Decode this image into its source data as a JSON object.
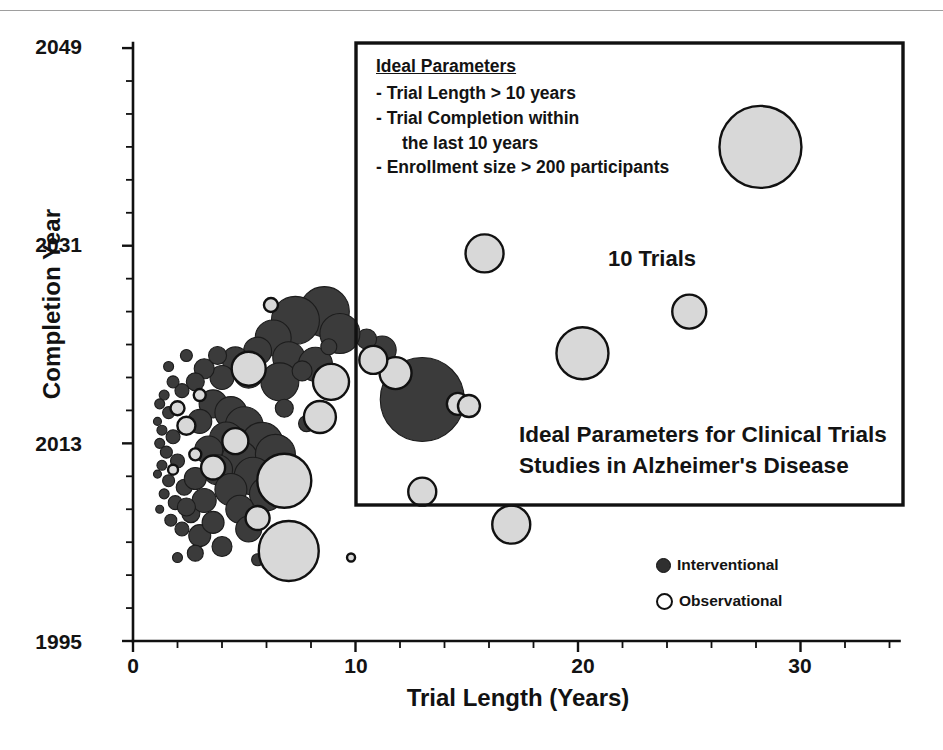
{
  "figure": {
    "caption_title": "Ideal Parameters for Clinical Trials Studies in Alzheimer's Disease",
    "trials_count_label": "10 Trials"
  },
  "callout": {
    "heading": "Ideal Parameters",
    "criteria": [
      "- Trial Length > 10 years",
      "- Trial Completion within",
      "the last 10 years",
      "- Enrollment size > 200 participants"
    ]
  },
  "legend": {
    "position": "bottom-right",
    "entries": [
      {
        "label": "Interventional",
        "marker": "filled-circle",
        "color": "#3b3b3b"
      },
      {
        "label": "Observational",
        "marker": "hollow-circle",
        "color": "#d8d8d8"
      }
    ]
  },
  "axes": {
    "x": {
      "label": "Trial Length (Years)",
      "ticks": [
        "0",
        "10",
        "20",
        "30"
      ],
      "tick_values": [
        0,
        10,
        20,
        30
      ],
      "minor_tick_step": 2,
      "range": [
        0,
        34
      ]
    },
    "y": {
      "label": "Completion Year",
      "ticks": [
        "1995",
        "2013",
        "2031",
        "2049"
      ],
      "tick_values": [
        1995,
        2013,
        2031,
        2049
      ],
      "minor_tick_step": 3,
      "range": [
        1995,
        2049
      ]
    }
  },
  "colors": {
    "interventional_fill": "#3b3b3b",
    "observational_fill": "#d8d8d8",
    "stroke": "#111111",
    "background": "#ffffff"
  },
  "chart_data": {
    "type": "scatter",
    "title": "Ideal Parameters for Clinical Trials Studies in Alzheimer's Disease",
    "xlabel": "Trial Length (Years)",
    "ylabel": "Completion Year",
    "xlim": [
      0,
      34
    ],
    "ylim": [
      1995,
      2049
    ],
    "grid": false,
    "legend_position": "bottom-right",
    "bubble_size_encodes": "Enrollment size (participants)",
    "annotations": [
      {
        "text": "10 Trials",
        "x": 21.5,
        "y": 2030.5
      },
      {
        "text": "Ideal Parameters for Clinical Trials Studies in Alzheimer's Disease",
        "x": 17.5,
        "y": 2013.5
      }
    ],
    "highlight_region": {
      "label": "Ideal Parameters region",
      "x_range": [
        10,
        34
      ],
      "y_range": [
        2009,
        2049
      ]
    },
    "series": [
      {
        "name": "Interventional",
        "marker": "filled-circle",
        "color": "#3b3b3b",
        "points": [
          {
            "x": 13.0,
            "y": 2017.0,
            "r": 42
          },
          {
            "x": 11.2,
            "y": 2021.5,
            "r": 14
          },
          {
            "x": 10.5,
            "y": 2022.5,
            "r": 10
          },
          {
            "x": 8.6,
            "y": 2025.0,
            "r": 25
          },
          {
            "x": 7.3,
            "y": 2024.2,
            "r": 24
          },
          {
            "x": 9.3,
            "y": 2023.0,
            "r": 20
          },
          {
            "x": 6.3,
            "y": 2022.6,
            "r": 18
          },
          {
            "x": 5.6,
            "y": 2021.4,
            "r": 14
          },
          {
            "x": 7.0,
            "y": 2020.8,
            "r": 16
          },
          {
            "x": 8.2,
            "y": 2020.2,
            "r": 17
          },
          {
            "x": 4.6,
            "y": 2020.6,
            "r": 13
          },
          {
            "x": 5.2,
            "y": 2019.4,
            "r": 15
          },
          {
            "x": 6.6,
            "y": 2018.6,
            "r": 19
          },
          {
            "x": 4.0,
            "y": 2019.0,
            "r": 12
          },
          {
            "x": 3.2,
            "y": 2019.8,
            "r": 10
          },
          {
            "x": 3.8,
            "y": 2021.0,
            "r": 9
          },
          {
            "x": 2.8,
            "y": 2018.6,
            "r": 9
          },
          {
            "x": 2.2,
            "y": 2017.8,
            "r": 7
          },
          {
            "x": 1.8,
            "y": 2018.6,
            "r": 6
          },
          {
            "x": 1.4,
            "y": 2017.4,
            "r": 5
          },
          {
            "x": 1.2,
            "y": 2016.6,
            "r": 5
          },
          {
            "x": 1.6,
            "y": 2015.8,
            "r": 6
          },
          {
            "x": 1.1,
            "y": 2015.0,
            "r": 4
          },
          {
            "x": 1.3,
            "y": 2014.2,
            "r": 5
          },
          {
            "x": 1.8,
            "y": 2013.6,
            "r": 7
          },
          {
            "x": 1.2,
            "y": 2013.0,
            "r": 5
          },
          {
            "x": 1.5,
            "y": 2012.2,
            "r": 6
          },
          {
            "x": 2.0,
            "y": 2011.4,
            "r": 7
          },
          {
            "x": 1.3,
            "y": 2011.0,
            "r": 5
          },
          {
            "x": 1.1,
            "y": 2010.2,
            "r": 4
          },
          {
            "x": 1.6,
            "y": 2009.6,
            "r": 6
          },
          {
            "x": 2.3,
            "y": 2009.0,
            "r": 8
          },
          {
            "x": 1.4,
            "y": 2008.4,
            "r": 5
          },
          {
            "x": 1.9,
            "y": 2007.6,
            "r": 7
          },
          {
            "x": 1.2,
            "y": 2007.0,
            "r": 4
          },
          {
            "x": 2.6,
            "y": 2006.6,
            "r": 9
          },
          {
            "x": 1.7,
            "y": 2006.0,
            "r": 6
          },
          {
            "x": 2.2,
            "y": 2005.2,
            "r": 7
          },
          {
            "x": 3.0,
            "y": 2004.6,
            "r": 11
          },
          {
            "x": 3.6,
            "y": 2016.6,
            "r": 14
          },
          {
            "x": 4.4,
            "y": 2015.8,
            "r": 16
          },
          {
            "x": 3.0,
            "y": 2015.0,
            "r": 12
          },
          {
            "x": 5.0,
            "y": 2014.6,
            "r": 19
          },
          {
            "x": 4.2,
            "y": 2013.4,
            "r": 17
          },
          {
            "x": 5.8,
            "y": 2013.0,
            "r": 21
          },
          {
            "x": 3.4,
            "y": 2012.4,
            "r": 14
          },
          {
            "x": 4.8,
            "y": 2011.6,
            "r": 18
          },
          {
            "x": 6.4,
            "y": 2012.0,
            "r": 20
          },
          {
            "x": 3.8,
            "y": 2010.6,
            "r": 15
          },
          {
            "x": 5.4,
            "y": 2010.0,
            "r": 19
          },
          {
            "x": 2.8,
            "y": 2009.8,
            "r": 11
          },
          {
            "x": 4.4,
            "y": 2008.8,
            "r": 16
          },
          {
            "x": 6.0,
            "y": 2008.4,
            "r": 17
          },
          {
            "x": 3.2,
            "y": 2007.8,
            "r": 12
          },
          {
            "x": 4.8,
            "y": 2007.0,
            "r": 14
          },
          {
            "x": 2.4,
            "y": 2007.2,
            "r": 9
          },
          {
            "x": 3.6,
            "y": 2005.8,
            "r": 11
          },
          {
            "x": 5.2,
            "y": 2005.2,
            "r": 13
          },
          {
            "x": 4.0,
            "y": 2003.6,
            "r": 10
          },
          {
            "x": 2.8,
            "y": 2003.0,
            "r": 8
          },
          {
            "x": 7.6,
            "y": 2019.6,
            "r": 10
          },
          {
            "x": 8.8,
            "y": 2021.8,
            "r": 8
          },
          {
            "x": 6.8,
            "y": 2016.2,
            "r": 9
          },
          {
            "x": 7.8,
            "y": 2014.8,
            "r": 8
          },
          {
            "x": 2.0,
            "y": 2002.6,
            "r": 5
          },
          {
            "x": 5.6,
            "y": 2002.4,
            "r": 6
          },
          {
            "x": 1.6,
            "y": 2020.0,
            "r": 5
          },
          {
            "x": 2.4,
            "y": 2021.0,
            "r": 6
          },
          {
            "x": 9.0,
            "y": 2018.0,
            "r": 7
          }
        ]
      },
      {
        "name": "Observational",
        "marker": "hollow-circle",
        "color": "#d8d8d8",
        "points": [
          {
            "x": 28.2,
            "y": 2040.0,
            "r": 41
          },
          {
            "x": 25.0,
            "y": 2025.0,
            "r": 17
          },
          {
            "x": 20.2,
            "y": 2021.2,
            "r": 26
          },
          {
            "x": 15.8,
            "y": 2030.3,
            "r": 19
          },
          {
            "x": 11.8,
            "y": 2019.4,
            "r": 16
          },
          {
            "x": 10.8,
            "y": 2020.6,
            "r": 14
          },
          {
            "x": 14.6,
            "y": 2016.6,
            "r": 11
          },
          {
            "x": 15.1,
            "y": 2016.4,
            "r": 11
          },
          {
            "x": 13.0,
            "y": 2008.6,
            "r": 14
          },
          {
            "x": 17.0,
            "y": 2005.6,
            "r": 19
          },
          {
            "x": 8.9,
            "y": 2018.6,
            "r": 18
          },
          {
            "x": 5.2,
            "y": 2019.8,
            "r": 17
          },
          {
            "x": 8.4,
            "y": 2015.4,
            "r": 16
          },
          {
            "x": 6.8,
            "y": 2009.6,
            "r": 27
          },
          {
            "x": 7.0,
            "y": 2003.2,
            "r": 30
          },
          {
            "x": 4.6,
            "y": 2013.2,
            "r": 13
          },
          {
            "x": 3.6,
            "y": 2010.8,
            "r": 12
          },
          {
            "x": 5.6,
            "y": 2006.2,
            "r": 12
          },
          {
            "x": 2.4,
            "y": 2014.6,
            "r": 9
          },
          {
            "x": 2.0,
            "y": 2016.2,
            "r": 7
          },
          {
            "x": 6.2,
            "y": 2025.6,
            "r": 7
          },
          {
            "x": 2.8,
            "y": 2012.0,
            "r": 6
          },
          {
            "x": 1.8,
            "y": 2010.6,
            "r": 5
          },
          {
            "x": 3.0,
            "y": 2017.4,
            "r": 6
          },
          {
            "x": 9.8,
            "y": 2002.6,
            "r": 4
          }
        ]
      }
    ]
  }
}
